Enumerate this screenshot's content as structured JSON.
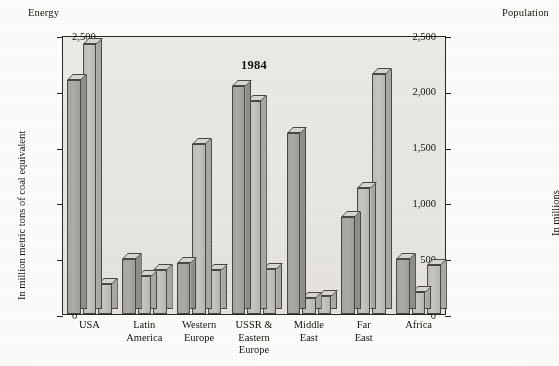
{
  "figure": {
    "title": "1984",
    "left_axis_header": "Energy",
    "right_axis_header": "Population",
    "left_axis_title": "In million metric tons of coal equivalent",
    "right_axis_title": "In millions"
  },
  "chart_data": {
    "type": "bar",
    "title": "1984",
    "xlabel": "",
    "ylabel": "In million metric tons of coal equivalent",
    "y2label": "In millions",
    "ylim": [
      0,
      2500
    ],
    "y2lim": [
      0,
      2500
    ],
    "yticks": [
      0,
      500,
      1000,
      1500,
      2000,
      2500
    ],
    "ytick_labels": [
      "0",
      "500",
      "1,000",
      "1,500",
      "2,000",
      "2,500"
    ],
    "y2ticks": [
      0,
      500,
      1000,
      1500,
      2000,
      2500
    ],
    "y2tick_labels": [
      "0",
      "500",
      "1,000",
      "1,500",
      "2,000",
      "2,500"
    ],
    "grid": false,
    "legend": "none",
    "bars_per_group": 3,
    "categories": [
      "USA",
      "Latin\nAmerica",
      "Western\nEurope",
      "USSR &\nEastern\nEurope",
      "Middle\nEast",
      "Far\nEast",
      "Africa"
    ],
    "series": [
      {
        "name": "bar-1",
        "shade": "dark",
        "values": [
          2100,
          490,
          460,
          2040,
          1620,
          870,
          490
        ]
      },
      {
        "name": "bar-2",
        "shade": "light",
        "values": [
          2420,
          345,
          1520,
          1910,
          140,
          1130,
          200
        ]
      },
      {
        "name": "bar-3",
        "shade": "light",
        "values": [
          270,
          390,
          395,
          400,
          160,
          2150,
          440
        ]
      }
    ]
  },
  "colors": {
    "plot_background": "#eceae6",
    "page_background": "#fdfdfb",
    "bar_dark": "#a8a6a1",
    "bar_light": "#c2c0bb",
    "bar_outline": "#4a4743",
    "axis": "#23211e",
    "text": "#15130f"
  }
}
